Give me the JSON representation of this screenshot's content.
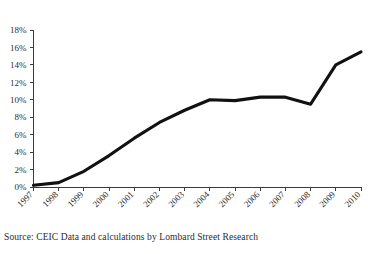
{
  "chart_data": {
    "type": "line",
    "title": "",
    "subtitle": "",
    "xlabel": "",
    "ylabel": "",
    "categories": [
      "1997",
      "1998",
      "1999",
      "2000",
      "2001",
      "2002",
      "2003",
      "2004",
      "2005",
      "2006",
      "2007",
      "2008",
      "2009",
      "2010"
    ],
    "values": [
      0.2,
      0.5,
      1.8,
      3.6,
      5.6,
      7.4,
      8.8,
      10.0,
      9.9,
      10.3,
      10.3,
      9.5,
      14.0,
      15.5
    ],
    "series": [
      {
        "name": "series-1",
        "values": [
          0.2,
          0.5,
          1.8,
          3.6,
          5.6,
          7.4,
          8.8,
          10.0,
          9.9,
          10.3,
          10.3,
          9.5,
          14.0,
          15.5
        ],
        "color": "#111111"
      }
    ],
    "ylim": [
      0,
      18
    ],
    "ytick_values": [
      0,
      2,
      4,
      6,
      8,
      10,
      12,
      14,
      16,
      18
    ],
    "ytick_labels": [
      "0%",
      "2%",
      "4%",
      "6%",
      "8%",
      "10%",
      "12%",
      "14%",
      "16%",
      "18%"
    ],
    "xtick_labels": [
      "1997",
      "1998",
      "1999",
      "2000",
      "2001",
      "2002",
      "2003",
      "2004",
      "2005",
      "2006",
      "2007",
      "2008",
      "2009",
      "2010"
    ],
    "xtick_rotation": -45,
    "grid": false,
    "legend": false,
    "legend_position": "none",
    "line_color": "#111111"
  },
  "caption": {
    "source_text": "Source: CEIC Data and calculations by Lombard Street Research"
  }
}
